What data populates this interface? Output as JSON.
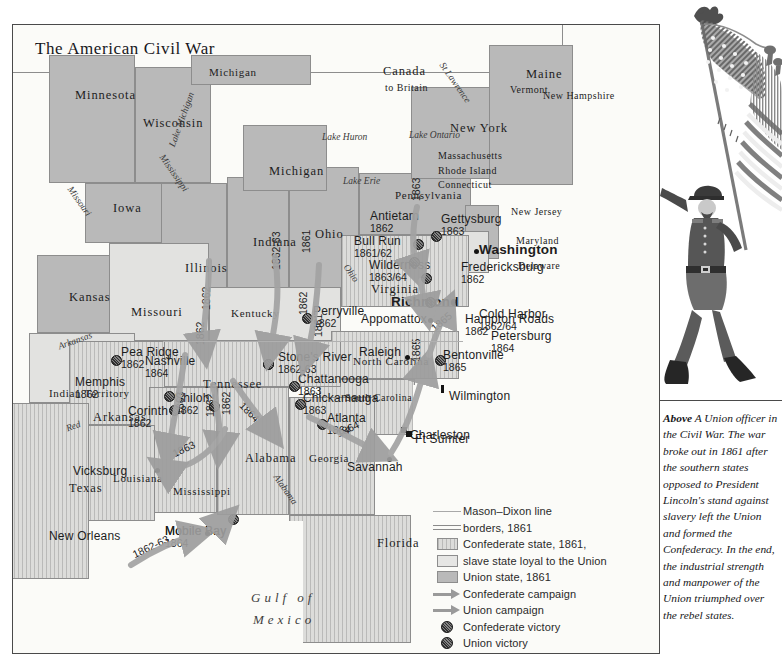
{
  "title": "The American Civil War",
  "map": {
    "states": [
      {
        "name": "Minnesota",
        "x": 62,
        "y": 64,
        "cls": "state"
      },
      {
        "name": "Wisconsin",
        "x": 130,
        "y": 92,
        "cls": "state"
      },
      {
        "name": "Michigan",
        "x": 196,
        "y": 42,
        "cls": "state-sm"
      },
      {
        "name": "Michigan",
        "x": 256,
        "y": 140,
        "cls": "state"
      },
      {
        "name": "Iowa",
        "x": 100,
        "y": 177,
        "cls": "state"
      },
      {
        "name": "Illinois",
        "x": 172,
        "y": 237,
        "cls": "state"
      },
      {
        "name": "Indiana",
        "x": 240,
        "y": 211,
        "cls": "state"
      },
      {
        "name": "Ohio",
        "x": 302,
        "y": 203,
        "cls": "state"
      },
      {
        "name": "Kansas",
        "x": 56,
        "y": 266,
        "cls": "state"
      },
      {
        "name": "Missouri",
        "x": 118,
        "y": 281,
        "cls": "state"
      },
      {
        "name": "Kentucky",
        "x": 218,
        "y": 283,
        "cls": "state-sm"
      },
      {
        "name": "Tennessee",
        "x": 190,
        "y": 353,
        "cls": "state"
      },
      {
        "name": "Arkansas",
        "x": 80,
        "y": 386,
        "cls": "state"
      },
      {
        "name": "Indian Territory",
        "x": 36,
        "y": 363,
        "cls": "state-sm"
      },
      {
        "name": "Texas",
        "x": 56,
        "y": 457,
        "cls": "state"
      },
      {
        "name": "Louisiana",
        "x": 100,
        "y": 448,
        "cls": "state-sm"
      },
      {
        "name": "Mississippi",
        "x": 160,
        "y": 461,
        "cls": "state-sm"
      },
      {
        "name": "Alabama",
        "x": 232,
        "y": 427,
        "cls": "state"
      },
      {
        "name": "Georgia",
        "x": 296,
        "y": 428,
        "cls": "state-sm"
      },
      {
        "name": "Florida",
        "x": 364,
        "y": 512,
        "cls": "state"
      },
      {
        "name": "North Carolina",
        "x": 340,
        "y": 331,
        "cls": "state-sm"
      },
      {
        "name": "South Carolina",
        "x": 332,
        "y": 368,
        "cls": "state-xs"
      },
      {
        "name": "Virginia",
        "x": 358,
        "y": 258,
        "cls": "state"
      },
      {
        "name": "Pennsylvania",
        "x": 382,
        "y": 165,
        "cls": "state-sm"
      },
      {
        "name": "New York",
        "x": 437,
        "y": 97,
        "cls": "state"
      },
      {
        "name": "Maine",
        "x": 513,
        "y": 43,
        "cls": "state"
      },
      {
        "name": "New Hampshire",
        "x": 530,
        "y": 66,
        "cls": "state-xs"
      },
      {
        "name": "Vermont",
        "x": 497,
        "y": 60,
        "cls": "state-xs"
      },
      {
        "name": "Massachusetts",
        "x": 425,
        "y": 126,
        "cls": "state-xs"
      },
      {
        "name": "Rhode Island",
        "x": 425,
        "y": 141,
        "cls": "state-xs"
      },
      {
        "name": "Connecticut",
        "x": 425,
        "y": 155,
        "cls": "state-xs"
      },
      {
        "name": "New Jersey",
        "x": 498,
        "y": 182,
        "cls": "state-xs"
      },
      {
        "name": "Maryland",
        "x": 503,
        "y": 211,
        "cls": "state-xs"
      },
      {
        "name": "Delaware",
        "x": 505,
        "y": 236,
        "cls": "state-xs"
      }
    ],
    "canada": {
      "name": "Canada",
      "sub": "to Britain",
      "x": 370,
      "y": 40
    },
    "waters": [
      {
        "name": "Lake Michigan",
        "x": 155,
        "y": 120,
        "rot": "rot-70",
        "cls": "water"
      },
      {
        "name": "Lake Huron",
        "x": 309,
        "y": 108,
        "rot": "",
        "cls": "water"
      },
      {
        "name": "Lake Erie",
        "x": 330,
        "y": 152,
        "rot": "",
        "cls": "water"
      },
      {
        "name": "Lake Ontario",
        "x": 396,
        "y": 106,
        "rot": "",
        "cls": "water"
      },
      {
        "name": "St Lawrence",
        "x": 432,
        "y": 36,
        "rot": "rot-p55",
        "cls": "water"
      },
      {
        "name": "Mississippi",
        "x": 152,
        "y": 128,
        "rot": "rot-p55",
        "cls": "water"
      },
      {
        "name": "Missouri",
        "x": 60,
        "y": 160,
        "rot": "rot-p55",
        "cls": "water"
      },
      {
        "name": "Arkansas",
        "x": 44,
        "y": 318,
        "rot": "rot-20",
        "cls": "water"
      },
      {
        "name": "Red",
        "x": 52,
        "y": 400,
        "rot": "rot-20",
        "cls": "water"
      },
      {
        "name": "Ohio",
        "x": 336,
        "y": 238,
        "rot": "rot-p55",
        "cls": "water"
      },
      {
        "name": "Alabama",
        "x": 266,
        "y": 448,
        "rot": "rot-p55",
        "cls": "water"
      }
    ],
    "gulf": {
      "line1": "Gulf of",
      "line2": "Mexico",
      "x": 250,
      "y": 570
    },
    "battles": [
      {
        "name": "Antietam",
        "year": "1862",
        "x": 357,
        "y": 185,
        "mx": 400,
        "my": 214,
        "vic": "confed",
        "lx": -1
      },
      {
        "name": "Bull Run",
        "year": "1861/62",
        "x": 341,
        "y": 210,
        "mx": 396,
        "my": 232,
        "vic": "confed",
        "lx": -1
      },
      {
        "name": "Gettysburg",
        "year": "1863",
        "x": 428,
        "y": 188,
        "mx": 418,
        "my": 206,
        "vic": "confed",
        "lx": -1
      },
      {
        "name": "Wilderness",
        "year": "1863/64",
        "x": 356,
        "y": 234,
        "mx": 408,
        "my": 248,
        "vic": "confed",
        "lx": -1
      },
      {
        "name": "Fredericksburg",
        "year": "1862",
        "x": 448,
        "y": 236,
        "mx": 406,
        "my": 239,
        "vic": "",
        "lx": -1
      },
      {
        "name": "Cold Harbor",
        "year": "1862/64",
        "x": 466,
        "y": 283,
        "mx": 412,
        "my": 272,
        "vic": "confed",
        "lx": -1
      },
      {
        "name": "Hampton Roads",
        "year": "1862",
        "x": 452,
        "y": 288,
        "mx": 443,
        "my": 290,
        "vic": "",
        "lx": -1
      },
      {
        "name": "Petersburg",
        "year": "1864",
        "x": 478,
        "y": 305,
        "mx": 414,
        "my": 288,
        "vic": "",
        "lx": -1
      },
      {
        "name": "Perryville",
        "year": "1862",
        "x": 300,
        "y": 280,
        "mx": 289,
        "my": 288,
        "vic": "union",
        "lx": -1
      },
      {
        "name": "Stone's River",
        "year": "1862-63",
        "x": 265,
        "y": 326,
        "mx": 250,
        "my": 334,
        "vic": "union",
        "lx": -1
      },
      {
        "name": "Chattanooga",
        "year": "1863",
        "x": 285,
        "y": 348,
        "mx": 276,
        "my": 356,
        "vic": "union",
        "lx": -1
      },
      {
        "name": "Chickamauga",
        "year": "1863",
        "x": 290,
        "y": 367,
        "mx": 282,
        "my": 374,
        "vic": "confed",
        "lx": -1
      },
      {
        "name": "Atlanta",
        "year": "1864",
        "x": 314,
        "y": 387,
        "mx": 304,
        "my": 394,
        "vic": "union",
        "lx": -1
      },
      {
        "name": "Nashville",
        "year": "1864",
        "x": 132,
        "y": 330,
        "mx": 250,
        "my": 334,
        "vic": "union",
        "lx": -1
      },
      {
        "name": "Memphis",
        "year": "1862",
        "x": 62,
        "y": 351,
        "mx": 151,
        "my": 366,
        "vic": "union",
        "lx": -1
      },
      {
        "name": "Corinth",
        "year": "1862",
        "x": 115,
        "y": 380,
        "mx": 156,
        "my": 380,
        "vic": "union",
        "lx": -1
      },
      {
        "name": "Shiloh",
        "year": "1862",
        "x": 162,
        "y": 367,
        "mx": 196,
        "my": 376,
        "vic": "union",
        "lx": -1
      },
      {
        "name": "Pea Ridge",
        "year": "1862",
        "x": 108,
        "y": 321,
        "mx": 98,
        "my": 330,
        "vic": "union",
        "lx": -1
      },
      {
        "name": "Bentonville",
        "year": "1865",
        "x": 430,
        "y": 324,
        "mx": 422,
        "my": 330,
        "vic": "union",
        "lx": -1
      },
      {
        "name": "Mobile Bay",
        "year": "1864",
        "x": 152,
        "y": 500,
        "mx": 215,
        "my": 489,
        "vic": "union",
        "lx": -1
      }
    ],
    "cities": [
      {
        "name": "Washington",
        "x": 466,
        "y": 218,
        "bold": true,
        "mk": "dot",
        "mx": 461,
        "my": 224
      },
      {
        "name": "Richmond",
        "x": 378,
        "y": 270,
        "bold": true,
        "mk": "dot",
        "mx": 438,
        "my": 275
      },
      {
        "name": "Raleigh",
        "x": 346,
        "y": 321,
        "bold": false,
        "mk": "dot",
        "mx": 392,
        "my": 330
      },
      {
        "name": "Appomattox",
        "x": 348,
        "y": 288,
        "bold": false,
        "mk": "dot",
        "mx": 415,
        "my": 293
      },
      {
        "name": "Wilmington",
        "x": 436,
        "y": 365,
        "bold": false,
        "mk": "pin",
        "mx": 428,
        "my": 360
      },
      {
        "name": "Charleston",
        "x": 397,
        "y": 404,
        "bold": false,
        "mk": "sq",
        "mx": 388,
        "my": 402
      },
      {
        "name": "Ft Sumter",
        "x": 402,
        "y": 408,
        "bold": false,
        "mk": "sq",
        "mx": 393,
        "my": 406
      },
      {
        "name": "Savannah",
        "x": 334,
        "y": 436,
        "bold": false,
        "mk": "dot",
        "mx": 374,
        "my": 432
      },
      {
        "name": "Vicksburg",
        "x": 60,
        "y": 440,
        "bold": false,
        "mk": "dot",
        "mx": 142,
        "my": 443
      },
      {
        "name": "New Orleans",
        "x": 36,
        "y": 505,
        "bold": false,
        "mk": "dot",
        "mx": 192,
        "my": 506
      },
      {
        "name": "Mobile Bay",
        "x": 152,
        "y": 500,
        "bold": false,
        "mk": "",
        "mx": 0,
        "my": 0
      }
    ],
    "campaign_years": [
      {
        "t": "1863",
        "x": 398,
        "y": 176,
        "rot": "rot-90"
      },
      {
        "t": "1861",
        "x": 288,
        "y": 228,
        "rot": "rot-90"
      },
      {
        "t": "1862-63",
        "x": 258,
        "y": 245,
        "rot": "rot-90"
      },
      {
        "t": "1862",
        "x": 188,
        "y": 285,
        "rot": "rot-90"
      },
      {
        "t": "1862",
        "x": 285,
        "y": 290,
        "rot": "rot-90"
      },
      {
        "t": "1862",
        "x": 182,
        "y": 320,
        "rot": "rot-90"
      },
      {
        "t": "1861",
        "x": 300,
        "y": 312,
        "rot": "rot-90"
      },
      {
        "t": "1863",
        "x": 162,
        "y": 390,
        "rot": "rot-90"
      },
      {
        "t": "1862",
        "x": 192,
        "y": 392,
        "rot": "rot-90"
      },
      {
        "t": "1862",
        "x": 208,
        "y": 390,
        "rot": "rot-90"
      },
      {
        "t": "1864",
        "x": 232,
        "y": 375,
        "rot": "rot-p45"
      },
      {
        "t": "1863",
        "x": 158,
        "y": 424,
        "rot": "rot-25"
      },
      {
        "t": "1864",
        "x": 322,
        "y": 404,
        "rot": "rot-25"
      },
      {
        "t": "1865",
        "x": 416,
        "y": 300,
        "rot": "rot-40"
      },
      {
        "t": "1865",
        "x": 398,
        "y": 337,
        "rot": "rot-90"
      },
      {
        "t": "1862-63",
        "x": 118,
        "y": 525,
        "rot": "rot-25"
      }
    ]
  },
  "legend": {
    "rows": [
      {
        "key": "mason-dixon-line",
        "label": "Mason–Dixon line"
      },
      {
        "key": "borders-1861",
        "label": "borders, 1861"
      },
      {
        "key": "confederate-state-swatch",
        "label": "Confederate state, 1861,"
      },
      {
        "key": "slave-state-loyal-swatch",
        "label": "slave state loyal to the Union"
      },
      {
        "key": "union-state-swatch",
        "label": "Union state, 1861"
      },
      {
        "key": "confederate-campaign-arrow",
        "label": "Confederate campaign"
      },
      {
        "key": "union-campaign-arrow",
        "label": "Union campaign"
      },
      {
        "key": "confederate-victory-marker",
        "label": "Confederate victory"
      },
      {
        "key": "union-victory-marker",
        "label": "Union victory"
      },
      {
        "key": "cotton-area-swatch",
        "label": "cotton growing area, 1860"
      }
    ]
  },
  "caption": {
    "above": "Above",
    "text": "  A Union officer in the Civil War. The war broke out in 1861 after the southern states opposed to President Lincoln's stand against slavery left the Union and formed the Confederacy. In the end, the industrial strength and manpower of the Union triumphed over the rebel states."
  },
  "illustration": {
    "name": "union-officer-with-flag",
    "flag": "us-flag-engraving",
    "soldier": "union-officer-figure"
  },
  "colors": {
    "union_state": "#b9b9b9",
    "loyal_slave_state": "#e2e2e0",
    "confederate_state": "#dcdcda",
    "arrow": "#9a9a9a",
    "border": "#8d8d8d",
    "text": "#1d1d1d"
  }
}
